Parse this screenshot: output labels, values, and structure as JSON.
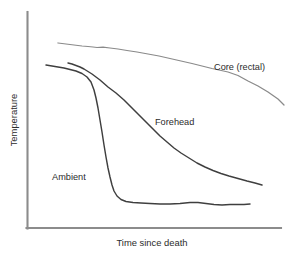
{
  "chart_data": {
    "type": "line",
    "title": "",
    "subtitle": "",
    "xlabel": "Time since death",
    "ylabel": "Temperature",
    "xlim": [
      0,
      100
    ],
    "ylim": [
      0,
      100
    ],
    "grid": false,
    "axis_ticks": false,
    "legend": "inline-annotations",
    "colors": {
      "core": "#8a8a8a",
      "forehead": "#3f3f3f",
      "ambient": "#3f3f3f",
      "axis": "#8c8c8c",
      "text": "#2b2b2b",
      "background": "#ffffff"
    },
    "series": [
      {
        "name": "Core (rectal)",
        "label": "Core (rectal)",
        "color": "#8a8a8a",
        "label_position": {
          "x": 214,
          "y": 70
        },
        "x": [
          58,
          66,
          74,
          82,
          88,
          93,
          97,
          103,
          110,
          118,
          127,
          137,
          148,
          159,
          170,
          181,
          192,
          200,
          206,
          212,
          219,
          228,
          238,
          248,
          258,
          268,
          278,
          284
        ],
        "y": [
          43,
          44,
          45,
          46,
          46.5,
          47,
          47.5,
          47.2,
          48,
          49,
          50.5,
          52,
          54,
          56,
          58.5,
          61,
          63.5,
          65.5,
          67,
          68.5,
          70,
          72,
          75.5,
          81,
          86,
          92,
          99,
          105
        ]
      },
      {
        "name": "Forehead",
        "label": "Forehead",
        "color": "#3f3f3f",
        "label_position": {
          "x": 155,
          "y": 125
        },
        "x": [
          68,
          72,
          76,
          80,
          84,
          88,
          92,
          96,
          100,
          104,
          108,
          112,
          116,
          120,
          124,
          128,
          133,
          138,
          143,
          148,
          154,
          160,
          167,
          174,
          181,
          189,
          197,
          205,
          213,
          221,
          229,
          238,
          247,
          255,
          262
        ],
        "y": [
          63,
          64,
          65.5,
          67,
          69,
          71.5,
          74,
          77,
          80,
          83.5,
          87,
          90,
          93,
          96.5,
          100,
          104,
          109,
          114,
          119,
          124,
          130,
          136,
          142,
          148,
          153,
          158,
          163,
          167,
          170.5,
          173.5,
          176,
          178.5,
          181,
          183,
          185
        ]
      },
      {
        "name": "Ambient",
        "label": "Ambient",
        "color": "#3f3f3f",
        "label_position": {
          "x": 52,
          "y": 180
        },
        "x": [
          46,
          52,
          58,
          64,
          70,
          76,
          82,
          87,
          91,
          94,
          96,
          98,
          100,
          102,
          104,
          106,
          108,
          110,
          112,
          114,
          117,
          121,
          126,
          133,
          141,
          150,
          160,
          170,
          180,
          190,
          198,
          206,
          214,
          222,
          230,
          238,
          244,
          250
        ],
        "y": [
          65,
          66,
          67,
          68,
          69.5,
          71,
          73.5,
          77,
          82,
          90,
          98,
          108,
          120,
          132,
          145,
          157,
          168,
          177,
          185,
          191,
          196,
          199.5,
          201.5,
          202.5,
          203,
          203.5,
          204,
          204,
          203.5,
          202.5,
          202.5,
          203.5,
          204.5,
          205,
          204.5,
          204.5,
          204.5,
          204
        ]
      }
    ],
    "axes": {
      "y_axis": {
        "x": 27,
        "y_top": 12,
        "y_bottom": 229
      },
      "x_axis": {
        "y": 228,
        "x_left": 26,
        "x_right": 281
      }
    }
  },
  "labels": {
    "core": "Core (rectal)",
    "forehead": "Forehead",
    "ambient": "Ambient",
    "x_axis_title": "Time since death",
    "y_axis_title": "Temperature"
  }
}
